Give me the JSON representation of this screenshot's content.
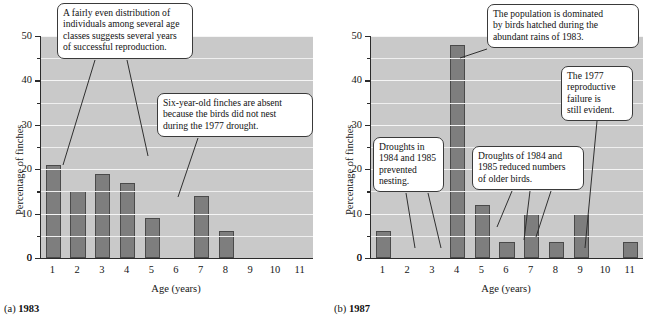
{
  "figure": {
    "panels": [
      {
        "caption_prefix": "(a)",
        "caption_year": "1983",
        "chart": {
          "type": "bar",
          "title": "",
          "xlabel": "Age (years)",
          "ylabel": "Percentage of finches",
          "categories": [
            "1",
            "2",
            "3",
            "4",
            "5",
            "6",
            "7",
            "8",
            "9",
            "10",
            "11"
          ],
          "values": [
            21,
            15,
            19,
            17,
            9,
            0,
            14,
            6,
            0,
            0,
            0
          ],
          "ylim": [
            0,
            50
          ],
          "yticks_major": [
            0,
            10,
            20,
            30,
            40,
            50
          ],
          "yticks_minor": [
            5,
            15,
            25,
            35,
            45
          ],
          "grid": true,
          "legend": "none"
        },
        "callouts": [
          {
            "id": "callout-even-distribution",
            "lines": [
              "A fairly even distribution of",
              "individuals among several age",
              "classes suggests several years",
              "of successful reproduction."
            ]
          },
          {
            "id": "callout-six-year-old-absent",
            "lines": [
              "Six-year-old finches are absent",
              "because the birds did not nest",
              "during the 1977 drought."
            ]
          }
        ]
      },
      {
        "caption_prefix": "(b)",
        "caption_year": "1987",
        "chart": {
          "type": "bar",
          "title": "",
          "xlabel": "Age (years)",
          "ylabel": "Percentage of finches",
          "categories": [
            "1",
            "2",
            "3",
            "4",
            "5",
            "6",
            "7",
            "8",
            "9",
            "10",
            "11"
          ],
          "values": [
            6,
            0,
            0,
            48,
            12,
            3.5,
            10,
            3.5,
            10,
            0,
            3.5
          ],
          "ylim": [
            0,
            50
          ],
          "yticks_major": [
            0,
            10,
            20,
            30,
            40,
            50
          ],
          "yticks_minor": [
            5,
            15,
            25,
            35,
            45
          ],
          "grid": true,
          "legend": "none"
        },
        "callouts": [
          {
            "id": "callout-population-dominated",
            "lines": [
              "The population is dominated",
              "by birds hatched during the",
              "abundant rains of 1983."
            ]
          },
          {
            "id": "callout-1977-failure",
            "lines": [
              "The 1977",
              "reproductive",
              "failure is",
              "still evident."
            ]
          },
          {
            "id": "callout-droughts-prevented-nesting",
            "lines": [
              "Droughts in",
              "1984 and 1985",
              "prevented",
              "nesting."
            ]
          },
          {
            "id": "callout-droughts-reduced-older",
            "lines": [
              "Droughts of 1984 and",
              "1985 reduced numbers",
              "of older birds."
            ]
          }
        ]
      }
    ]
  },
  "chart_data": [
    {
      "type": "bar",
      "panel": "(a) 1983",
      "title": "1983",
      "categories": [
        "1",
        "2",
        "3",
        "4",
        "5",
        "6",
        "7",
        "8",
        "9",
        "10",
        "11"
      ],
      "values": [
        21,
        15,
        19,
        17,
        9,
        0,
        14,
        6,
        0,
        0,
        0
      ],
      "xlabel": "Age (years)",
      "ylabel": "Percentage of finches",
      "ylim": [
        0,
        50
      ],
      "yticks": [
        0,
        10,
        20,
        30,
        40,
        50
      ],
      "grid": true,
      "legend": "none",
      "annotations": [
        "A fairly even distribution of individuals among several age classes suggests several years of successful reproduction.",
        "Six-year-old finches are absent because the birds did not nest during the 1977 drought."
      ]
    },
    {
      "type": "bar",
      "panel": "(b) 1987",
      "title": "1987",
      "categories": [
        "1",
        "2",
        "3",
        "4",
        "5",
        "6",
        "7",
        "8",
        "9",
        "10",
        "11"
      ],
      "values": [
        6,
        0,
        0,
        48,
        12,
        3.5,
        10,
        3.5,
        10,
        0,
        3.5
      ],
      "xlabel": "Age (years)",
      "ylabel": "Percentage of finches",
      "ylim": [
        0,
        50
      ],
      "yticks": [
        0,
        10,
        20,
        30,
        40,
        50
      ],
      "grid": true,
      "legend": "none",
      "annotations": [
        "The population is dominated by birds hatched during the abundant rains of 1983.",
        "The 1977 reproductive failure is still evident.",
        "Droughts in 1984 and 1985 prevented nesting.",
        "Droughts of 1984 and 1985 reduced numbers of older birds."
      ]
    }
  ],
  "colors": {
    "bar_fill": "#7e7e7e",
    "bar_stroke": "#4a4a4a",
    "plot_background": "#c9c9c9",
    "gridline": "#f0f0f0",
    "axis": "#2b2b2b",
    "callout_background": "#ffffff",
    "callout_border": "#3a3a3a",
    "page_background": "#ffffff"
  }
}
